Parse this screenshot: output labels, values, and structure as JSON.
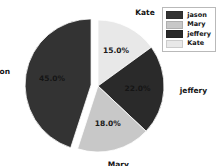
{
  "chart_data": {
    "type": "pie",
    "title": "",
    "labels": [
      "jason",
      "Mary",
      "jeffery",
      "Kate"
    ],
    "values": [
      45.0,
      18.0,
      22.0,
      15.0
    ],
    "value_labels": [
      "45.0%",
      "18.0%",
      "22.0%",
      "15.0%"
    ],
    "colors": [
      "#333333",
      "#c8c8c8",
      "#2a2a2a",
      "#e8e8e8"
    ],
    "exploded": [
      "jason"
    ],
    "start_angle_deg": 90,
    "direction": "clockwise",
    "slices": [
      {
        "name": "Kate",
        "value": 15.0,
        "value_label": "15.0%",
        "color": "#e8e8e8",
        "exploded": false
      },
      {
        "name": "jeffery",
        "value": 22.0,
        "value_label": "22.0%",
        "color": "#2a2a2a",
        "exploded": false
      },
      {
        "name": "Mary",
        "value": 18.0,
        "value_label": "18.0%",
        "color": "#c8c8c8",
        "exploded": false
      },
      {
        "name": "jason",
        "value": 45.0,
        "value_label": "45.0%",
        "color": "#333333",
        "exploded": true
      }
    ],
    "outer_labels": [
      {
        "name": "Kate",
        "text": "Kate"
      },
      {
        "name": "jeffery",
        "text": "jeffery"
      },
      {
        "name": "Mary",
        "text": "Mary"
      },
      {
        "name": "jason",
        "text": "jason"
      }
    ],
    "legend": {
      "position": "top-right",
      "entries": [
        {
          "label": "jason",
          "color": "#333333"
        },
        {
          "label": "Mary",
          "color": "#c8c8c8"
        },
        {
          "label": "jeffery",
          "color": "#2a2a2a"
        },
        {
          "label": "Kate",
          "color": "#e8e8e8"
        }
      ]
    },
    "background": "#ffffff",
    "grid": false
  }
}
